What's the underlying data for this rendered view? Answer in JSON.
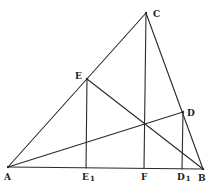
{
  "diagram": {
    "type": "geometry-triangle-altitudes",
    "points": {
      "A": {
        "label": "A",
        "x": 8,
        "y": 167
      },
      "B": {
        "label": "B",
        "x": 203,
        "y": 169
      },
      "C": {
        "label": "C",
        "x": 146,
        "y": 13
      },
      "E": {
        "label": "E",
        "x": 87,
        "y": 79
      },
      "D": {
        "label": "D",
        "x": 183,
        "y": 112
      },
      "E1": {
        "label": "E",
        "sub": "1",
        "x": 86,
        "y": 168
      },
      "F": {
        "label": "F",
        "x": 144,
        "y": 168
      },
      "D1": {
        "label": "D",
        "sub": "1",
        "x": 182,
        "y": 169
      }
    },
    "segments": [
      [
        "A",
        "B"
      ],
      [
        "B",
        "C"
      ],
      [
        "C",
        "A"
      ],
      [
        "C",
        "F"
      ],
      [
        "A",
        "D"
      ],
      [
        "B",
        "E"
      ],
      [
        "E",
        "E1"
      ],
      [
        "D",
        "D1"
      ]
    ],
    "labels": {
      "A": "A",
      "B": "B",
      "C": "C",
      "D": "D",
      "E": "E",
      "F": "F",
      "E1_main": "E",
      "E1_sub": "1",
      "D1_main": "D",
      "D1_sub": "1"
    }
  }
}
